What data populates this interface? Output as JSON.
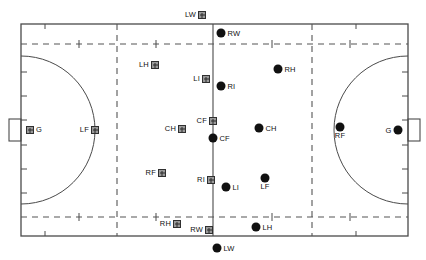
{
  "diagram": {
    "colors": {
      "line": "#4a4a4a",
      "dash": "#555555",
      "dot": "#111111",
      "square_fill": "#9a9a9a",
      "square_border": "#303030",
      "background": "#ffffff"
    },
    "court": {
      "left": 21,
      "top": 24,
      "right": 408,
      "bottom": 236,
      "center_line_x": 213,
      "dashed_vertical_left_x": 117,
      "dashed_vertical_right_x": 312,
      "dashed_horizontal_top_y": 44,
      "dashed_horizontal_bottom_y": 217,
      "goal_area_radius": 74,
      "goal_box_width": 12,
      "goal_box_height": 22
    },
    "goals": [
      {
        "name": "left-goal",
        "x": 21,
        "y": 130
      },
      {
        "name": "right-goal",
        "x": 408,
        "y": 130
      }
    ],
    "tick_marks": {
      "top": [
        45,
        356
      ],
      "bottom": [
        45,
        356
      ],
      "left": [
        72,
        96,
        120,
        145,
        169,
        193
      ],
      "right": [
        72,
        96,
        120,
        145,
        169,
        193
      ],
      "dashed_top": [
        79,
        156,
        272,
        350
      ],
      "dashed_bottom": [
        79,
        156,
        272,
        350
      ]
    },
    "markers": [
      {
        "name": "marker-lw-square",
        "label": "LW",
        "type": "square",
        "x": 202,
        "y": 15,
        "label_pos": "left"
      },
      {
        "name": "marker-rw-dot",
        "label": "RW",
        "type": "dot",
        "x": 221,
        "y": 33,
        "label_pos": "right"
      },
      {
        "name": "marker-lh-square",
        "label": "LH",
        "type": "square",
        "x": 155,
        "y": 65,
        "label_pos": "left"
      },
      {
        "name": "marker-li-square",
        "label": "LI",
        "type": "square",
        "x": 206,
        "y": 79,
        "label_pos": "left"
      },
      {
        "name": "marker-ri-dot",
        "label": "RI",
        "type": "dot",
        "x": 221,
        "y": 86,
        "label_pos": "right"
      },
      {
        "name": "marker-rh-dot",
        "label": "RH",
        "type": "dot",
        "x": 278,
        "y": 69,
        "label_pos": "right"
      },
      {
        "name": "marker-ch-square",
        "label": "CH",
        "type": "square",
        "x": 182,
        "y": 129,
        "label_pos": "left"
      },
      {
        "name": "marker-cf-square",
        "label": "CF",
        "type": "square",
        "x": 213,
        "y": 121,
        "label_pos": "left"
      },
      {
        "name": "marker-cf-dot",
        "label": "CF",
        "type": "dot",
        "x": 213,
        "y": 138,
        "label_pos": "right"
      },
      {
        "name": "marker-ch-dot",
        "label": "CH",
        "type": "dot",
        "x": 259,
        "y": 128,
        "label_pos": "right"
      },
      {
        "name": "marker-left-goalkeeper-square",
        "label": "G",
        "type": "square",
        "x": 30,
        "y": 130,
        "label_pos": "right"
      },
      {
        "name": "marker-lf-square",
        "label": "LF",
        "type": "square",
        "x": 95,
        "y": 130,
        "label_pos": "left"
      },
      {
        "name": "marker-rf-dot",
        "label": "RF",
        "type": "dot",
        "x": 340,
        "y": 127,
        "label_pos": "below"
      },
      {
        "name": "marker-right-goalkeeper-dot",
        "label": "G",
        "type": "dot",
        "x": 398,
        "y": 130,
        "label_pos": "left"
      },
      {
        "name": "marker-rf-square",
        "label": "RF",
        "type": "square",
        "x": 162,
        "y": 173,
        "label_pos": "left"
      },
      {
        "name": "marker-ri-square",
        "label": "RI",
        "type": "square",
        "x": 211,
        "y": 180,
        "label_pos": "left"
      },
      {
        "name": "marker-li-dot",
        "label": "LI",
        "type": "dot",
        "x": 226,
        "y": 187,
        "label_pos": "right"
      },
      {
        "name": "marker-lf-dot",
        "label": "LF",
        "type": "dot",
        "x": 265,
        "y": 178,
        "label_pos": "below"
      },
      {
        "name": "marker-rh-square",
        "label": "RH",
        "type": "square",
        "x": 177,
        "y": 224,
        "label_pos": "left"
      },
      {
        "name": "marker-rw-square",
        "label": "RW",
        "type": "square",
        "x": 209,
        "y": 230,
        "label_pos": "left"
      },
      {
        "name": "marker-lh-dot",
        "label": "LH",
        "type": "dot",
        "x": 256,
        "y": 227,
        "label_pos": "right"
      },
      {
        "name": "marker-lw-dot",
        "label": "LW",
        "type": "dot",
        "x": 217,
        "y": 248,
        "label_pos": "right"
      }
    ]
  }
}
